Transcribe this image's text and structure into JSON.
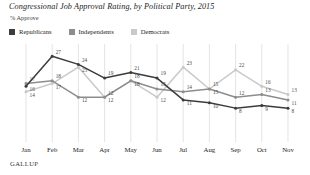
{
  "title": "Congressional Job Approval Rating, by Political Party, 2015",
  "subtitle": "% Approve",
  "footer": "GALLUP",
  "colors": {
    "republicans": "#3c3c3c",
    "independents": "#8d8d8d",
    "democrats": "#c9c9c9",
    "gridline": "#d8d8d8",
    "text": "#2b2b2b"
  },
  "legend": {
    "position": "top-left",
    "items": [
      {
        "label": "Republicans",
        "color": "#3c3c3c",
        "swatch": "square-swatch"
      },
      {
        "label": "Independents",
        "color": "#8d8d8d",
        "swatch": "square-swatch"
      },
      {
        "label": "Democrats",
        "color": "#c9c9c9",
        "swatch": "square-swatch"
      }
    ]
  },
  "chart_data": {
    "type": "line",
    "title": "Congressional Job Approval Rating, by Political Party, 2015",
    "subtitle": "% Approve",
    "xlabel": "",
    "ylabel": "% Approve",
    "ylim": [
      0,
      30
    ],
    "grid": "vertical-only",
    "categories": [
      "Jan",
      "Feb",
      "Mar",
      "Apr",
      "May",
      "Jun",
      "Jul",
      "Aug",
      "Sep",
      "Oct",
      "Nov"
    ],
    "series": [
      {
        "name": "Republicans",
        "color": "#3c3c3c",
        "values": [
          16,
          27,
          24,
          19,
          21,
          19,
          11,
          10,
          8,
          9,
          8
        ]
      },
      {
        "name": "Independents",
        "color": "#8d8d8d",
        "values": [
          17,
          18,
          12,
          12,
          18,
          15,
          14,
          15,
          12,
          13,
          11
        ]
      },
      {
        "name": "Democrats",
        "color": "#c9c9c9",
        "values": [
          14,
          17,
          23,
          12,
          18,
          12,
          23,
          15,
          22,
          16,
          13
        ]
      }
    ],
    "point_labels": {
      "Jan": [
        16,
        17,
        14
      ],
      "Feb": [
        27,
        18,
        17
      ],
      "Mar": [
        24,
        12,
        23
      ],
      "Apr": [
        19,
        12,
        12
      ],
      "May": [
        21,
        18,
        18
      ],
      "Jun": [
        19,
        15,
        12
      ],
      "Jul": [
        11,
        14,
        23
      ],
      "Aug": [
        10,
        15,
        15
      ],
      "Sep": [
        8,
        12,
        22
      ],
      "Oct": [
        9,
        13,
        16
      ],
      "Nov": [
        8,
        11,
        13
      ]
    }
  }
}
